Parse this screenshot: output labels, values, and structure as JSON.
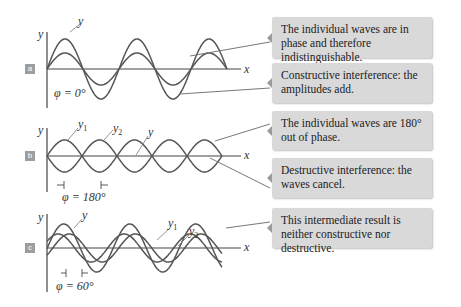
{
  "panels": [
    {
      "id": "a",
      "badge": "a",
      "axis_y": "y",
      "axis_x": "x",
      "wave_labels": [
        "y"
      ],
      "phase_label": "φ = 0°",
      "callouts": [
        "The individual waves are in phase and therefore indistinguishable.",
        "Constructive interference: the amplitudes add."
      ]
    },
    {
      "id": "b",
      "badge": "b",
      "axis_y": "y",
      "axis_x": "x",
      "wave_labels": [
        "y1",
        "y2",
        "y"
      ],
      "phase_label": "φ = 180°",
      "callouts": [
        "The individual waves are 180° out of phase.",
        "Destructive interference: the waves cancel."
      ]
    },
    {
      "id": "c",
      "badge": "c",
      "axis_y": "y",
      "axis_x": "x",
      "wave_labels": [
        "y",
        "y1",
        "y2"
      ],
      "phase_label": "φ = 60°",
      "callouts": [
        "This intermediate result is neither constructive nor destructive."
      ]
    }
  ],
  "colors": {
    "wave": "#555555",
    "axis": "#444444",
    "callout_bg": "#d9d9d9",
    "badge_bg": "#9d9d9d"
  }
}
